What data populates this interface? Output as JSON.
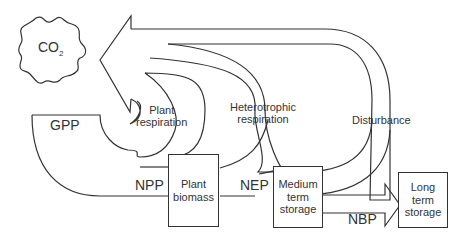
{
  "nodes": {
    "co2": {
      "label": "CO",
      "subscript": "2"
    },
    "plant_biomass": {
      "label": "Plant\nbiomass"
    },
    "medium_term_storage": {
      "label": "Medium\nterm\nstorage"
    },
    "long_term_storage": {
      "label": "Long\nterm\nstorage"
    }
  },
  "flows": {
    "gpp": "GPP",
    "npp": "NPP",
    "nep": "NEP",
    "nbp": "NBP",
    "plant_respiration": "Plant\nrespiration",
    "heterotrophic_respiration": "Heterotrophic\nrespiration",
    "disturbance": "Disturbance"
  },
  "colors": {
    "stroke": "#333333",
    "background": "#ffffff"
  }
}
